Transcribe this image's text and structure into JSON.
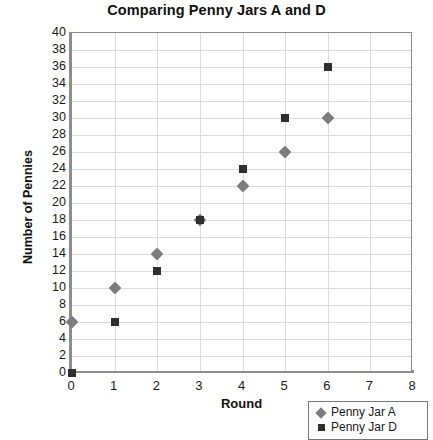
{
  "chart_data": {
    "type": "scatter",
    "title": "Comparing Penny Jars A and D",
    "xlabel": "Round",
    "ylabel": "Number of Pennies",
    "xlim": [
      0,
      8
    ],
    "ylim": [
      0,
      40
    ],
    "xticks": [
      0,
      1,
      2,
      3,
      4,
      5,
      6,
      7,
      8
    ],
    "yticks": [
      0,
      2,
      4,
      6,
      8,
      10,
      12,
      14,
      16,
      18,
      20,
      22,
      24,
      26,
      28,
      30,
      32,
      34,
      36,
      38,
      40
    ],
    "grid": true,
    "legend_position": "bottom-right",
    "x": [
      0,
      1,
      2,
      3,
      4,
      5,
      6
    ],
    "series": [
      {
        "name": "Penny Jar A",
        "marker": "diamond",
        "color": "#7d7d7d",
        "values": [
          6,
          10,
          14,
          18,
          22,
          26,
          30
        ]
      },
      {
        "name": "Penny Jar D",
        "marker": "square",
        "color": "#2f2f2f",
        "values": [
          0,
          6,
          12,
          18,
          24,
          30,
          36
        ]
      }
    ]
  },
  "legend": {
    "items": [
      {
        "label": "Penny Jar A",
        "marker": "diamond"
      },
      {
        "label": "Penny Jar D",
        "marker": "square"
      }
    ]
  }
}
